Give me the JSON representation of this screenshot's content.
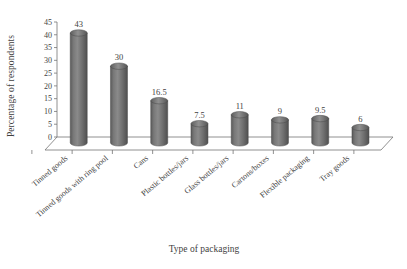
{
  "chart_data": {
    "type": "bar",
    "title": "",
    "subtitle": "",
    "xlabel": "Type of packaging",
    "ylabel": "Percentage of respondents",
    "categories": [
      "Tinned goods",
      "Tinned goods with ring pool",
      "Cans",
      "Plastic bottles/jars",
      "Glass bottles/jars",
      "Cartons/boxes",
      "Flexible packaging",
      "Tray goods"
    ],
    "values": [
      43,
      30,
      16.5,
      7.5,
      11,
      9,
      9.5,
      6
    ],
    "value_labels": [
      "43",
      "30",
      "16.5",
      "7.5",
      "11",
      "9",
      "9.5",
      "6"
    ],
    "ylim": [
      0,
      45
    ],
    "yticks": [
      0,
      5,
      10,
      15,
      20,
      25,
      30,
      35,
      40,
      45
    ],
    "ytick_labels": [
      "0",
      "5",
      "10",
      "15",
      "20",
      "25",
      "30",
      "35",
      "40",
      "45"
    ],
    "grid": false,
    "legend": null,
    "legend_position": "none",
    "style": "3d-cylinder",
    "bar_color": "#6e6e6e",
    "bar_color_light": "#8d8d8d",
    "bar_color_dark": "#555555",
    "axis_color": "#6a6a6a",
    "text_color": "#3f3f3f",
    "background": "#ffffff"
  }
}
